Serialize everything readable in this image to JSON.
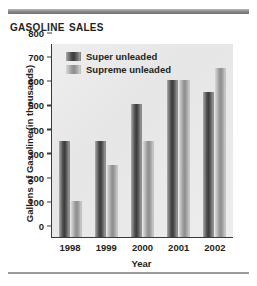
{
  "title": "Gasoline Sales",
  "bottom_rule": true,
  "chart_data": {
    "type": "bar",
    "title": "Gasoline Sales",
    "xlabel": "Year",
    "ylabel": "Gallons of Gasoline (in thousands)",
    "categories": [
      "1998",
      "1999",
      "2000",
      "2001",
      "2002"
    ],
    "series": [
      {
        "name": "Super unleaded",
        "values": [
          400,
          400,
          550,
          650,
          600
        ],
        "color": "#4e4e4e"
      },
      {
        "name": "Supreme unleaded",
        "values": [
          150,
          300,
          400,
          650,
          700
        ],
        "color": "#a8a8a8"
      }
    ],
    "ylim": [
      0,
      800
    ],
    "yticks": [
      0,
      100,
      200,
      300,
      400,
      500,
      600,
      700,
      800
    ],
    "ytick_labels": [
      "0",
      "100",
      "200",
      "300",
      "400",
      "500",
      "600",
      "700",
      "800"
    ],
    "grid": false,
    "legend_position": "top-left",
    "legend": [
      "Super unleaded",
      "Supreme unleaded"
    ]
  }
}
